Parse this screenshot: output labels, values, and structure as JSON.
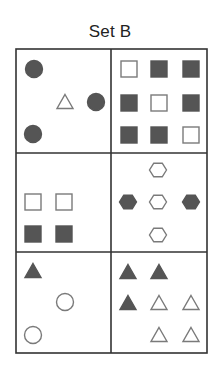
{
  "title": "Set B",
  "colors": {
    "line": "#333333",
    "fill_dark": "#555555",
    "outline": "#7a7a7a",
    "background": "#ffffff"
  },
  "grid": {
    "rows": 3,
    "cols": 2,
    "x": [
      16,
      111,
      207
    ],
    "y": [
      49,
      153,
      252,
      353
    ]
  },
  "cells": [
    {
      "name": "cell-r1-c1",
      "description": "3 dark circles, 1 open triangle",
      "shapes": [
        {
          "type": "circle",
          "fill": "dark",
          "cx": 34,
          "cy": 69,
          "size": 18
        },
        {
          "type": "triangle",
          "fill": "open",
          "cx": 65,
          "cy": 102,
          "size": 16
        },
        {
          "type": "circle",
          "fill": "dark",
          "cx": 96,
          "cy": 102,
          "size": 18
        },
        {
          "type": "circle",
          "fill": "dark",
          "cx": 33,
          "cy": 134,
          "size": 18
        }
      ]
    },
    {
      "name": "cell-r1-c2",
      "description": "3x3 squares, open on diagonal, dark elsewhere",
      "shapes": [
        {
          "type": "square",
          "fill": "open",
          "cx": 129,
          "cy": 69,
          "size": 17
        },
        {
          "type": "square",
          "fill": "dark",
          "cx": 159,
          "cy": 69,
          "size": 17
        },
        {
          "type": "square",
          "fill": "dark",
          "cx": 191,
          "cy": 69,
          "size": 17
        },
        {
          "type": "square",
          "fill": "dark",
          "cx": 129,
          "cy": 103,
          "size": 17
        },
        {
          "type": "square",
          "fill": "open",
          "cx": 159,
          "cy": 103,
          "size": 17
        },
        {
          "type": "square",
          "fill": "dark",
          "cx": 191,
          "cy": 103,
          "size": 17
        },
        {
          "type": "square",
          "fill": "dark",
          "cx": 129,
          "cy": 135,
          "size": 17
        },
        {
          "type": "square",
          "fill": "dark",
          "cx": 159,
          "cy": 135,
          "size": 17
        },
        {
          "type": "square",
          "fill": "open",
          "cx": 191,
          "cy": 135,
          "size": 17
        }
      ]
    },
    {
      "name": "cell-r2-c1",
      "description": "2 open squares over 2 dark squares",
      "shapes": [
        {
          "type": "square",
          "fill": "open",
          "cx": 33,
          "cy": 202,
          "size": 17
        },
        {
          "type": "square",
          "fill": "open",
          "cx": 64,
          "cy": 202,
          "size": 17
        },
        {
          "type": "square",
          "fill": "dark",
          "cx": 33,
          "cy": 234,
          "size": 17
        },
        {
          "type": "square",
          "fill": "dark",
          "cx": 64,
          "cy": 234,
          "size": 17
        }
      ]
    },
    {
      "name": "cell-r2-c2",
      "description": "hexagons in a cross: 3 open vertical, 2 dark horizontal sides",
      "shapes": [
        {
          "type": "hexagon",
          "fill": "open",
          "cx": 158,
          "cy": 170,
          "size": 17
        },
        {
          "type": "hexagon",
          "fill": "dark",
          "cx": 128,
          "cy": 202,
          "size": 17
        },
        {
          "type": "hexagon",
          "fill": "open",
          "cx": 158,
          "cy": 202,
          "size": 17
        },
        {
          "type": "hexagon",
          "fill": "dark",
          "cx": 191,
          "cy": 202,
          "size": 17
        },
        {
          "type": "hexagon",
          "fill": "open",
          "cx": 158,
          "cy": 235,
          "size": 17
        }
      ]
    },
    {
      "name": "cell-r3-c1",
      "description": "1 dark triangle, 2 open circles",
      "shapes": [
        {
          "type": "triangle",
          "fill": "dark",
          "cx": 33,
          "cy": 271,
          "size": 16
        },
        {
          "type": "circle",
          "fill": "open",
          "cx": 65,
          "cy": 302,
          "size": 18
        },
        {
          "type": "circle",
          "fill": "open",
          "cx": 33,
          "cy": 335,
          "size": 18
        }
      ]
    },
    {
      "name": "cell-r3-c2",
      "description": "3 dark triangles, 4 open triangles",
      "shapes": [
        {
          "type": "triangle",
          "fill": "dark",
          "cx": 128,
          "cy": 272,
          "size": 16
        },
        {
          "type": "triangle",
          "fill": "dark",
          "cx": 159,
          "cy": 272,
          "size": 16
        },
        {
          "type": "triangle",
          "fill": "dark",
          "cx": 128,
          "cy": 303,
          "size": 16
        },
        {
          "type": "triangle",
          "fill": "open",
          "cx": 159,
          "cy": 303,
          "size": 16
        },
        {
          "type": "triangle",
          "fill": "open",
          "cx": 191,
          "cy": 303,
          "size": 16
        },
        {
          "type": "triangle",
          "fill": "open",
          "cx": 159,
          "cy": 335,
          "size": 16
        },
        {
          "type": "triangle",
          "fill": "open",
          "cx": 191,
          "cy": 335,
          "size": 16
        }
      ]
    }
  ]
}
